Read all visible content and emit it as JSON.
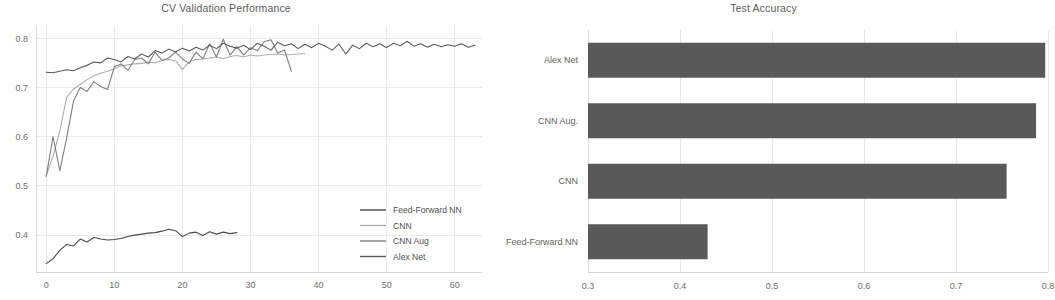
{
  "figure": {
    "background": "#ffffff",
    "width": 1055,
    "height": 300
  },
  "panels": {
    "left": {
      "title": "CV Validation Performance"
    },
    "right": {
      "title": "Test Accuracy"
    }
  },
  "legend": {
    "position": "lower-right-of-left-panel",
    "entries": [
      {
        "label": "Feed-Forward NN",
        "color": "#4a4a4a"
      },
      {
        "label": "CNN",
        "color": "#aeaeae"
      },
      {
        "label": "CNN Aug",
        "color": "#7f7f7f"
      },
      {
        "label": "Alex Net",
        "color": "#5a5a5a"
      }
    ]
  },
  "chart_data": [
    {
      "type": "line",
      "title": "CV Validation Performance",
      "xlabel": "",
      "ylabel": "",
      "xlim": [
        -1.5,
        64
      ],
      "ylim": [
        0.325,
        0.825
      ],
      "grid": true,
      "legend_position": "lower right",
      "xticks": [
        0,
        10,
        20,
        30,
        40,
        50,
        60
      ],
      "xtick_labels": [
        "0",
        "10",
        "20",
        "30",
        "40",
        "50",
        "60"
      ],
      "yticks": [
        0.4,
        0.5,
        0.6,
        0.7,
        0.8
      ],
      "ytick_labels": [
        "0.4",
        "0.5",
        "0.6",
        "0.7",
        "0.8"
      ],
      "series": [
        {
          "name": "Feed-Forward NN",
          "color": "#4a4a4a",
          "x": [
            0,
            1,
            2,
            3,
            4,
            5,
            6,
            7,
            8,
            9,
            10,
            11,
            12,
            13,
            14,
            15,
            16,
            17,
            18,
            19,
            20,
            21,
            22,
            23,
            24,
            25,
            26,
            27,
            28
          ],
          "values": [
            0.342,
            0.352,
            0.369,
            0.381,
            0.378,
            0.392,
            0.386,
            0.395,
            0.392,
            0.39,
            0.391,
            0.393,
            0.397,
            0.4,
            0.402,
            0.404,
            0.405,
            0.408,
            0.412,
            0.409,
            0.397,
            0.404,
            0.406,
            0.399,
            0.407,
            0.402,
            0.406,
            0.403,
            0.405
          ]
        },
        {
          "name": "CNN",
          "color": "#aeaeae",
          "x": [
            0,
            1,
            2,
            3,
            4,
            5,
            6,
            7,
            8,
            9,
            10,
            11,
            12,
            13,
            14,
            15,
            16,
            17,
            18,
            19,
            20,
            21,
            22,
            23,
            24,
            25,
            26,
            27,
            28,
            29,
            30,
            31,
            32,
            33,
            34,
            35,
            36,
            37,
            38
          ],
          "values": [
            0.521,
            0.56,
            0.612,
            0.68,
            0.697,
            0.706,
            0.716,
            0.724,
            0.729,
            0.733,
            0.738,
            0.744,
            0.746,
            0.748,
            0.749,
            0.752,
            0.75,
            0.755,
            0.757,
            0.754,
            0.737,
            0.752,
            0.757,
            0.758,
            0.76,
            0.762,
            0.759,
            0.763,
            0.765,
            0.762,
            0.766,
            0.764,
            0.766,
            0.767,
            0.768,
            0.766,
            0.767,
            0.768,
            0.769
          ]
        },
        {
          "name": "CNN Aug",
          "color": "#7f7f7f",
          "x": [
            0,
            1,
            2,
            3,
            4,
            5,
            6,
            7,
            8,
            9,
            10,
            11,
            12,
            13,
            14,
            15,
            16,
            17,
            18,
            19,
            20,
            21,
            22,
            23,
            24,
            25,
            26,
            27,
            28,
            29,
            30,
            31,
            32,
            33,
            34,
            35,
            36
          ],
          "values": [
            0.519,
            0.6,
            0.531,
            0.597,
            0.672,
            0.7,
            0.692,
            0.712,
            0.702,
            0.696,
            0.742,
            0.748,
            0.735,
            0.757,
            0.76,
            0.748,
            0.772,
            0.755,
            0.76,
            0.772,
            0.758,
            0.749,
            0.772,
            0.758,
            0.789,
            0.762,
            0.798,
            0.766,
            0.783,
            0.766,
            0.781,
            0.775,
            0.793,
            0.797,
            0.77,
            0.776,
            0.733
          ]
        },
        {
          "name": "Alex Net",
          "color": "#5a5a5a",
          "x": [
            0,
            1,
            2,
            3,
            4,
            5,
            6,
            7,
            8,
            9,
            10,
            11,
            12,
            13,
            14,
            15,
            16,
            17,
            18,
            19,
            20,
            21,
            22,
            23,
            24,
            25,
            26,
            27,
            28,
            29,
            30,
            31,
            32,
            33,
            34,
            35,
            36,
            37,
            38,
            39,
            40,
            41,
            42,
            43,
            44,
            45,
            46,
            47,
            48,
            49,
            50,
            51,
            52,
            53,
            54,
            55,
            56,
            57,
            58,
            59,
            60,
            61,
            62,
            63
          ],
          "values": [
            0.731,
            0.73,
            0.733,
            0.736,
            0.734,
            0.74,
            0.745,
            0.752,
            0.75,
            0.76,
            0.757,
            0.752,
            0.763,
            0.758,
            0.768,
            0.762,
            0.775,
            0.77,
            0.778,
            0.772,
            0.78,
            0.774,
            0.782,
            0.776,
            0.786,
            0.779,
            0.79,
            0.784,
            0.78,
            0.786,
            0.777,
            0.79,
            0.784,
            0.776,
            0.792,
            0.785,
            0.789,
            0.779,
            0.788,
            0.781,
            0.79,
            0.784,
            0.776,
            0.788,
            0.768,
            0.786,
            0.779,
            0.79,
            0.783,
            0.789,
            0.781,
            0.79,
            0.785,
            0.794,
            0.784,
            0.789,
            0.782,
            0.788,
            0.783,
            0.787,
            0.784,
            0.789,
            0.782,
            0.786
          ]
        }
      ]
    },
    {
      "type": "bar",
      "orientation": "horizontal",
      "title": "Test Accuracy",
      "xlabel": "",
      "ylabel": "",
      "grid": true,
      "bar_color": "#595959",
      "xlim": [
        0.3,
        0.8
      ],
      "xticks": [
        0.3,
        0.4,
        0.5,
        0.6,
        0.7,
        0.8
      ],
      "xtick_labels": [
        "0.3",
        "0.4",
        "0.5",
        "0.6",
        "0.7",
        "0.8"
      ],
      "categories": [
        "Alex Net",
        "CNN Aug.",
        "CNN",
        "Feed-Forward NN"
      ],
      "values": [
        0.797,
        0.787,
        0.755,
        0.43
      ]
    }
  ]
}
